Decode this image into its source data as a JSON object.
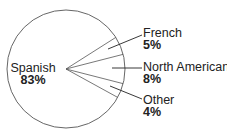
{
  "chart_data": {
    "type": "pie",
    "title": "",
    "categories": [
      "Spanish",
      "French",
      "North American",
      "Other"
    ],
    "values": [
      83,
      5,
      8,
      4
    ],
    "labels": [
      {
        "name": "Spanish",
        "pct": "83%"
      },
      {
        "name": "French",
        "pct": "5%"
      },
      {
        "name": "North American",
        "pct": "8%"
      },
      {
        "name": "Other",
        "pct": "4%"
      }
    ],
    "unit": "%",
    "legend": "none (direct labels; small slices labeled outside with leader lines)",
    "colors": {
      "fill": "#ffffff",
      "outline": "#555555",
      "text": "#222222"
    }
  }
}
